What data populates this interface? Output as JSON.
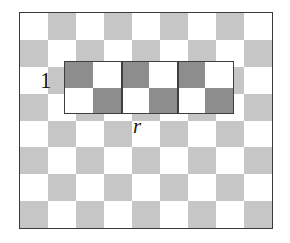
{
  "figure": {
    "colors": {
      "board_light": "#ffffff",
      "board_shade": "#c6c6c6",
      "rect_shade": "#8d8d8d",
      "outline": "#3a3a3a",
      "rect_outline": "#3f3f3f",
      "label_color": "#1a1a1a"
    },
    "board": {
      "columns": 9,
      "rows": 8,
      "start_color": "light",
      "pattern": [
        [
          "light",
          "shade",
          "light",
          "shade",
          "light",
          "shade",
          "light",
          "shade",
          "light"
        ],
        [
          "shade",
          "light",
          "shade",
          "light",
          "shade",
          "light",
          "shade",
          "light",
          "shade"
        ],
        [
          "light",
          "shade",
          "light",
          "shade",
          "light",
          "shade",
          "light",
          "shade",
          "light"
        ],
        [
          "shade",
          "light",
          "shade",
          "light",
          "shade",
          "light",
          "shade",
          "light",
          "shade"
        ],
        [
          "light",
          "shade",
          "light",
          "shade",
          "light",
          "shade",
          "light",
          "shade",
          "light"
        ],
        [
          "shade",
          "light",
          "shade",
          "light",
          "shade",
          "light",
          "shade",
          "light",
          "shade"
        ],
        [
          "light",
          "shade",
          "light",
          "shade",
          "light",
          "shade",
          "light",
          "shade",
          "light"
        ],
        [
          "shade",
          "light",
          "shade",
          "light",
          "shade",
          "light",
          "shade",
          "light",
          "shade"
        ]
      ]
    },
    "rectangle": {
      "columns": 6,
      "rows": 2,
      "start_col": 2,
      "start_row": 3,
      "separator_after_columns": [
        2,
        4
      ],
      "pattern": [
        [
          "shade",
          "light",
          "shade",
          "light",
          "shade",
          "light"
        ],
        [
          "light",
          "shade",
          "light",
          "shade",
          "light",
          "shade"
        ]
      ]
    },
    "labels": {
      "height_label": "1",
      "width_label": "r"
    }
  }
}
